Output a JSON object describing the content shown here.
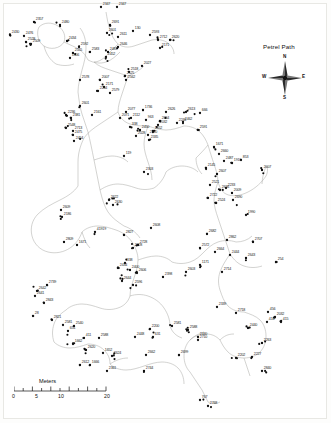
{
  "figure": {
    "type": "spatial-point-map",
    "background": "#ffffff",
    "frame_color": "#b8b8b4",
    "point_color": "#111111",
    "path_color": "#9a9a96"
  },
  "legend": {
    "title": "Petrel Path",
    "compass": {
      "north": "N",
      "south": "S",
      "east": "E",
      "west": "W",
      "icon": "compass-rose-star"
    }
  },
  "scale_bar": {
    "title": "Meters",
    "ticks": [
      "0",
      "5",
      "10",
      "20"
    ],
    "tick_positions_px": [
      0,
      23,
      46,
      92
    ],
    "minor_tick_count": 11
  },
  "chart_data": {
    "type": "scatter",
    "title": "Petrel Path",
    "xlabel": "",
    "ylabel": "",
    "units": "Meters",
    "point_labels": [
      {
        "id": "2357",
        "x": 34,
        "y": 22
      },
      {
        "id": "2430",
        "x": 10,
        "y": 35
      },
      {
        "id": "2476",
        "x": 24,
        "y": 36
      },
      {
        "id": "2528",
        "x": 26,
        "y": 42
      },
      {
        "id": "2509",
        "x": 31,
        "y": 44
      },
      {
        "id": "2480",
        "x": 60,
        "y": 25
      },
      {
        "id": "2434",
        "x": 67,
        "y": 41
      },
      {
        "id": "2592",
        "x": 79,
        "y": 47
      },
      {
        "id": "2555",
        "x": 73,
        "y": 53
      },
      {
        "id": "1806",
        "x": 70,
        "y": 58
      },
      {
        "id": "2347",
        "x": 101,
        "y": 7
      },
      {
        "id": "2347b",
        "x": 117,
        "y": 7
      },
      {
        "id": "2691",
        "x": 110,
        "y": 25
      },
      {
        "id": "2601",
        "x": 107,
        "y": 33
      },
      {
        "id": "130",
        "x": 133,
        "y": 31
      },
      {
        "id": "2611",
        "x": 118,
        "y": 37
      },
      {
        "id": "2593",
        "x": 150,
        "y": 35
      },
      {
        "id": "2712",
        "x": 158,
        "y": 40
      },
      {
        "id": "2620",
        "x": 170,
        "y": 40
      },
      {
        "id": "2646",
        "x": 118,
        "y": 47
      },
      {
        "id": "2171",
        "x": 160,
        "y": 48
      },
      {
        "id": "2483",
        "x": 108,
        "y": 52
      },
      {
        "id": "2452",
        "x": 106,
        "y": 57
      },
      {
        "id": "2583",
        "x": 90,
        "y": 52
      },
      {
        "id": "2027",
        "x": 142,
        "y": 66
      },
      {
        "id": "2518",
        "x": 129,
        "y": 72
      },
      {
        "id": "2525",
        "x": 125,
        "y": 76
      },
      {
        "id": "2562",
        "x": 126,
        "y": 80
      },
      {
        "id": "2578",
        "x": 80,
        "y": 80
      },
      {
        "id": "2007",
        "x": 100,
        "y": 80
      },
      {
        "id": "2171b",
        "x": 104,
        "y": 87
      },
      {
        "id": "2204",
        "x": 98,
        "y": 91
      },
      {
        "id": "2579",
        "x": 110,
        "y": 93
      },
      {
        "id": "2601b",
        "x": 80,
        "y": 106
      },
      {
        "id": "2236",
        "x": 66,
        "y": 115
      },
      {
        "id": "2381",
        "x": 71,
        "y": 118
      },
      {
        "id": "2161",
        "x": 92,
        "y": 115
      },
      {
        "id": "2077",
        "x": 126,
        "y": 112
      },
      {
        "id": "2071",
        "x": 120,
        "y": 118
      },
      {
        "id": "2112",
        "x": 131,
        "y": 118
      },
      {
        "id": "2548",
        "x": 66,
        "y": 128
      },
      {
        "id": "2713",
        "x": 73,
        "y": 131
      },
      {
        "id": "2475",
        "x": 73,
        "y": 135
      },
      {
        "id": "2454",
        "x": 74,
        "y": 141
      },
      {
        "id": "1736",
        "x": 143,
        "y": 110
      },
      {
        "id": "2626",
        "x": 166,
        "y": 112
      },
      {
        "id": "2613",
        "x": 186,
        "y": 112
      },
      {
        "id": "666",
        "x": 200,
        "y": 113
      },
      {
        "id": "963",
        "x": 146,
        "y": 120
      },
      {
        "id": "2664",
        "x": 160,
        "y": 121
      },
      {
        "id": "2462",
        "x": 183,
        "y": 122
      },
      {
        "id": "338",
        "x": 130,
        "y": 127
      },
      {
        "id": "2450",
        "x": 140,
        "y": 130
      },
      {
        "id": "1652",
        "x": 153,
        "y": 131
      },
      {
        "id": "2510",
        "x": 148,
        "y": 135
      },
      {
        "id": "2028",
        "x": 136,
        "y": 136
      },
      {
        "id": "2032",
        "x": 158,
        "y": 125
      },
      {
        "id": "2335",
        "x": 149,
        "y": 140
      },
      {
        "id": "119",
        "x": 124,
        "y": 156
      },
      {
        "id": "2303",
        "x": 144,
        "y": 172
      },
      {
        "id": "2246",
        "x": 177,
        "y": 123
      },
      {
        "id": "2591",
        "x": 198,
        "y": 130
      },
      {
        "id": "1671",
        "x": 214,
        "y": 147
      },
      {
        "id": "2660",
        "x": 219,
        "y": 154
      },
      {
        "id": "2487",
        "x": 224,
        "y": 161
      },
      {
        "id": "1910",
        "x": 232,
        "y": 163
      },
      {
        "id": "853",
        "x": 241,
        "y": 160
      },
      {
        "id": "2145",
        "x": 206,
        "y": 168
      },
      {
        "id": "2607",
        "x": 217,
        "y": 174
      },
      {
        "id": "2007b",
        "x": 262,
        "y": 170
      },
      {
        "id": "2521",
        "x": 210,
        "y": 185
      },
      {
        "id": "2233",
        "x": 226,
        "y": 188
      },
      {
        "id": "2636",
        "x": 220,
        "y": 190
      },
      {
        "id": "2009",
        "x": 232,
        "y": 193
      },
      {
        "id": "2722",
        "x": 208,
        "y": 198
      },
      {
        "id": "2690",
        "x": 233,
        "y": 200
      },
      {
        "id": "2524",
        "x": 216,
        "y": 203
      },
      {
        "id": "2609",
        "x": 61,
        "y": 210
      },
      {
        "id": "2186",
        "x": 62,
        "y": 217
      },
      {
        "id": "2622",
        "x": 109,
        "y": 200
      },
      {
        "id": "2630",
        "x": 113,
        "y": 205
      },
      {
        "id": "1990",
        "x": 246,
        "y": 215
      },
      {
        "id": "2608",
        "x": 151,
        "y": 228
      },
      {
        "id": "41919",
        "x": 95,
        "y": 232
      },
      {
        "id": "2827",
        "x": 124,
        "y": 235
      },
      {
        "id": "2809",
        "x": 64,
        "y": 242
      },
      {
        "id": "1671b",
        "x": 77,
        "y": 245
      },
      {
        "id": "2707",
        "x": 253,
        "y": 242
      },
      {
        "id": "2862",
        "x": 227,
        "y": 240
      },
      {
        "id": "2682",
        "x": 207,
        "y": 234
      },
      {
        "id": "2728",
        "x": 138,
        "y": 245
      },
      {
        "id": "2328",
        "x": 133,
        "y": 248
      },
      {
        "id": "2572",
        "x": 200,
        "y": 248
      },
      {
        "id": "2664b",
        "x": 215,
        "y": 252
      },
      {
        "id": "2444",
        "x": 230,
        "y": 255
      },
      {
        "id": "2643",
        "x": 246,
        "y": 258
      },
      {
        "id": "254",
        "x": 276,
        "y": 262
      },
      {
        "id": "2714",
        "x": 222,
        "y": 272
      },
      {
        "id": "2603",
        "x": 186,
        "y": 272
      },
      {
        "id": "1171",
        "x": 200,
        "y": 265
      },
      {
        "id": "338b",
        "x": 125,
        "y": 263
      },
      {
        "id": "2434",
        "x": 118,
        "y": 268
      },
      {
        "id": "2400",
        "x": 130,
        "y": 270
      },
      {
        "id": "2606",
        "x": 137,
        "y": 273
      },
      {
        "id": "2644",
        "x": 122,
        "y": 281
      },
      {
        "id": "2596",
        "x": 133,
        "y": 285
      },
      {
        "id": "2398",
        "x": 163,
        "y": 277
      },
      {
        "id": "2739",
        "x": 47,
        "y": 285
      },
      {
        "id": "2642",
        "x": 37,
        "y": 291
      },
      {
        "id": "2641",
        "x": 35,
        "y": 296
      },
      {
        "id": "2843",
        "x": 44,
        "y": 303
      },
      {
        "id": "28",
        "x": 33,
        "y": 316
      },
      {
        "id": "2821",
        "x": 52,
        "y": 320
      },
      {
        "id": "2339",
        "x": 217,
        "y": 307
      },
      {
        "id": "2718",
        "x": 236,
        "y": 313
      },
      {
        "id": "456",
        "x": 268,
        "y": 312
      },
      {
        "id": "2032b",
        "x": 275,
        "y": 317
      },
      {
        "id": "416",
        "x": 267,
        "y": 322
      },
      {
        "id": "415",
        "x": 281,
        "y": 322
      },
      {
        "id": "2440",
        "x": 248,
        "y": 328
      },
      {
        "id": "2581",
        "x": 172,
        "y": 326
      },
      {
        "id": "2588",
        "x": 188,
        "y": 330
      },
      {
        "id": "2200",
        "x": 150,
        "y": 329
      },
      {
        "id": "2440b",
        "x": 198,
        "y": 337
      },
      {
        "id": "2581b",
        "x": 63,
        "y": 325
      },
      {
        "id": "2540",
        "x": 74,
        "y": 326
      },
      {
        "id": "651",
        "x": 68,
        "y": 331
      },
      {
        "id": "411",
        "x": 84,
        "y": 338
      },
      {
        "id": "2588b",
        "x": 99,
        "y": 338
      },
      {
        "id": "1662",
        "x": 73,
        "y": 344
      },
      {
        "id": "2620b",
        "x": 86,
        "y": 350
      },
      {
        "id": "2448",
        "x": 135,
        "y": 337
      },
      {
        "id": "631",
        "x": 153,
        "y": 337
      },
      {
        "id": "1652b",
        "x": 103,
        "y": 353
      },
      {
        "id": "2624",
        "x": 112,
        "y": 356
      },
      {
        "id": "2662",
        "x": 146,
        "y": 355
      },
      {
        "id": "2699",
        "x": 179,
        "y": 355
      },
      {
        "id": "2612",
        "x": 80,
        "y": 365
      },
      {
        "id": "1666",
        "x": 90,
        "y": 365
      },
      {
        "id": "2361",
        "x": 107,
        "y": 371
      },
      {
        "id": "2744",
        "x": 144,
        "y": 371
      },
      {
        "id": "2710",
        "x": 198,
        "y": 340
      },
      {
        "id": "2263",
        "x": 262,
        "y": 343
      },
      {
        "id": "2202",
        "x": 236,
        "y": 358
      },
      {
        "id": "2227",
        "x": 252,
        "y": 357
      },
      {
        "id": "2840",
        "x": 262,
        "y": 371
      },
      {
        "id": "767",
        "x": 200,
        "y": 400
      },
      {
        "id": "2768",
        "x": 208,
        "y": 406
      }
    ],
    "n_points_approx": 330,
    "legend_position": "top-right",
    "grid": false
  }
}
